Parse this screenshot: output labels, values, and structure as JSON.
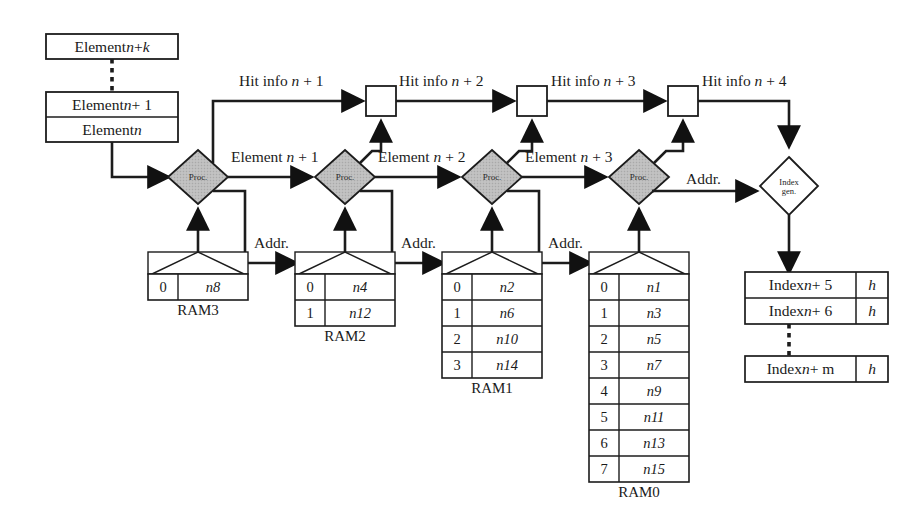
{
  "diagram": {
    "element_list": {
      "top_box_label": "Element n + k",
      "mid_box_label": "Element n + 1",
      "bottom_box_label": "Element n",
      "dotted_connector": true
    },
    "processors": [
      {
        "label": "Proc.",
        "fill": "#b9b9b9"
      },
      {
        "label": "Proc.",
        "fill": "#b9b9b9"
      },
      {
        "label": "Proc.",
        "fill": "#b9b9b9"
      },
      {
        "label": "Proc.",
        "fill": "#b9b9b9"
      }
    ],
    "index_gen": {
      "line1": "Index",
      "line2": "gen.",
      "fill": "#ffffff"
    },
    "hit_info_labels": [
      "Hit info n + 1",
      "Hit info n + 2",
      "Hit info n + 3",
      "Hit info n + 4"
    ],
    "element_flow_labels": [
      "Element n + 1",
      "Element n + 2",
      "Element n + 3"
    ],
    "addr_labels": [
      "Addr.",
      "Addr.",
      "Addr.",
      "Addr."
    ],
    "hit_registers": 4,
    "rams": [
      {
        "name": "RAM3",
        "columns": [
          "addr",
          "value"
        ],
        "rows": [
          {
            "addr": "0",
            "value": "n8"
          }
        ]
      },
      {
        "name": "RAM2",
        "columns": [
          "addr",
          "value"
        ],
        "rows": [
          {
            "addr": "0",
            "value": "n4"
          },
          {
            "addr": "1",
            "value": "n12"
          }
        ]
      },
      {
        "name": "RAM1",
        "columns": [
          "addr",
          "value"
        ],
        "rows": [
          {
            "addr": "0",
            "value": "n2"
          },
          {
            "addr": "1",
            "value": "n6"
          },
          {
            "addr": "2",
            "value": "n10"
          },
          {
            "addr": "3",
            "value": "n14"
          }
        ]
      },
      {
        "name": "RAM0",
        "columns": [
          "addr",
          "value"
        ],
        "rows": [
          {
            "addr": "0",
            "value": "n1"
          },
          {
            "addr": "1",
            "value": "n3"
          },
          {
            "addr": "2",
            "value": "n5"
          },
          {
            "addr": "3",
            "value": "n7"
          },
          {
            "addr": "4",
            "value": "n9"
          },
          {
            "addr": "5",
            "value": "n11"
          },
          {
            "addr": "6",
            "value": "n13"
          },
          {
            "addr": "7",
            "value": "n15"
          }
        ]
      }
    ],
    "index_list": {
      "rows": [
        {
          "label": "Index n + 5",
          "flag": "h"
        },
        {
          "label": "Index n + 6",
          "flag": "h"
        }
      ],
      "dotted_connector": true,
      "last_row": {
        "label": "Index n + m",
        "flag": "h"
      }
    },
    "colors": {
      "stroke": "#1c1c1c",
      "proc_fill": "#b9b9b9",
      "box_fill": "#ffffff",
      "background": "#ffffff",
      "table_stroke": "#3a3a3a"
    }
  }
}
